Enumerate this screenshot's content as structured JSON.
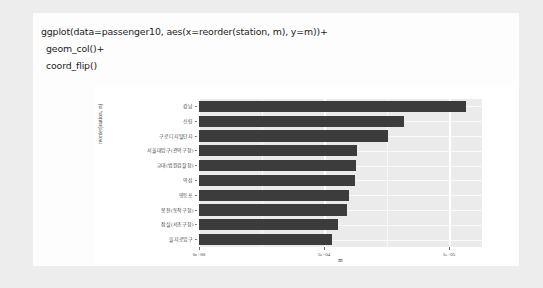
{
  "code": {
    "lines": [
      "ggplot(data=passenger10, aes(x=reorder(station, m), y=m))+",
      "geom_col()+",
      "coord_flip()"
    ]
  },
  "colors": {
    "page_background": "#ededed",
    "card_background": "#fdfdfd",
    "panel_background": "#ebebeb",
    "bar_fill": "#3c3c3c",
    "grid_line": "#ffffff",
    "axis_text": "#3d3d3d"
  },
  "chart_data": {
    "type": "bar",
    "orientation": "horizontal",
    "title": "",
    "xlabel": "m",
    "ylabel": "reorder(station, m)",
    "xlim": [
      0,
      113000
    ],
    "xticks": [
      0,
      50000,
      100000
    ],
    "xticklabels": [
      "0e+00",
      "5e+04",
      "1e+05"
    ],
    "grid": true,
    "legend": "none",
    "categories": [
      "강남",
      "신림",
      "구로디지털단지",
      "서울대입구(관악구청)",
      "교대(법원검찰청)",
      "역삼",
      "영등포",
      "봉천(동작구청)",
      "잠실(서초구청)",
      "을지로입구"
    ],
    "values": [
      106500,
      81800,
      75300,
      63200,
      62800,
      62100,
      59700,
      58900,
      55400,
      53100
    ]
  }
}
